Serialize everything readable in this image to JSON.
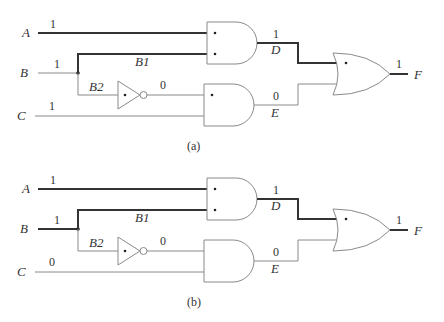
{
  "circuits": [
    {
      "caption": "(a)",
      "inputs": {
        "A": {
          "label": "A",
          "value": "1"
        },
        "B": {
          "label": "B",
          "value": "1"
        },
        "C": {
          "label": "C",
          "value": "1"
        }
      },
      "branches": {
        "B1": "B1",
        "B2": "B2"
      },
      "inverter_output": "0",
      "gates": {
        "and1": {
          "output_label": "D",
          "output_value": "1",
          "marked_inputs": 2
        },
        "and2": {
          "output_label": "E",
          "output_value": "0",
          "marked_inputs": 1
        },
        "or": {
          "marked_inputs": 1
        }
      },
      "output": {
        "label": "F",
        "value": "1"
      }
    },
    {
      "caption": "(b)",
      "inputs": {
        "A": {
          "label": "A",
          "value": "1"
        },
        "B": {
          "label": "B",
          "value": "1"
        },
        "C": {
          "label": "C",
          "value": "0"
        }
      },
      "branches": {
        "B1": "B1",
        "B2": "B2"
      },
      "inverter_output": "0",
      "gates": {
        "and1": {
          "output_label": "D",
          "output_value": "1",
          "marked_inputs": 2
        },
        "and2": {
          "output_label": "E",
          "output_value": "0",
          "marked_inputs": 0
        },
        "or": {
          "marked_inputs": 1
        }
      },
      "output": {
        "label": "F",
        "value": "1"
      }
    }
  ],
  "colors": {
    "active_wire": "#333333",
    "inactive_wire": "#8a8a8a",
    "background": "#ffffff"
  }
}
